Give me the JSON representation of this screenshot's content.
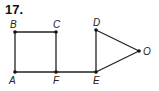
{
  "problem_number": "17.",
  "diagram": {
    "points": [
      {
        "name": "A",
        "x": 15,
        "y": 72,
        "lx": 9,
        "ly": 84
      },
      {
        "name": "B",
        "x": 15,
        "y": 32,
        "lx": 10,
        "ly": 28
      },
      {
        "name": "C",
        "x": 56,
        "y": 32,
        "lx": 53,
        "ly": 28
      },
      {
        "name": "F",
        "x": 56,
        "y": 72,
        "lx": 53,
        "ly": 84
      },
      {
        "name": "D",
        "x": 96,
        "y": 30,
        "lx": 93,
        "ly": 26
      },
      {
        "name": "E",
        "x": 96,
        "y": 72,
        "lx": 93,
        "ly": 84
      },
      {
        "name": "O",
        "x": 139,
        "y": 51,
        "lx": 143,
        "ly": 55
      }
    ],
    "segments": [
      [
        "A",
        "B"
      ],
      [
        "B",
        "C"
      ],
      [
        "C",
        "F"
      ],
      [
        "A",
        "F"
      ],
      [
        "F",
        "E"
      ],
      [
        "D",
        "E"
      ],
      [
        "D",
        "O"
      ],
      [
        "E",
        "O"
      ]
    ],
    "line_color": "#222222"
  }
}
